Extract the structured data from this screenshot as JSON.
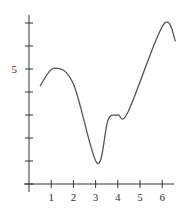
{
  "chart_data": {
    "type": "line",
    "title": "",
    "xlabel": "",
    "ylabel": "",
    "x_ticks": [
      1,
      2,
      3,
      4,
      5,
      6
    ],
    "x_tick_labels": [
      "1",
      "2",
      "3",
      "4",
      "5",
      "6"
    ],
    "y_ticks": [
      0,
      1,
      2,
      3,
      4,
      5,
      6,
      7
    ],
    "y_tick_labels": [
      "",
      "",
      "",
      "",
      "",
      "5",
      "",
      ""
    ],
    "xlim": [
      0,
      6.8
    ],
    "ylim": [
      0,
      7.5
    ],
    "grid": false,
    "legend": null,
    "series": [
      {
        "name": "curve",
        "x": [
          0.5,
          1.13,
          2.0,
          3.06,
          3.56,
          4.0,
          4.46,
          6.04,
          6.6
        ],
        "y": [
          4.26,
          5.04,
          4.35,
          0.91,
          2.78,
          3.0,
          3.13,
          6.91,
          6.2
        ]
      }
    ],
    "colors": {
      "axis": "#333333",
      "curve": "#555555"
    }
  }
}
